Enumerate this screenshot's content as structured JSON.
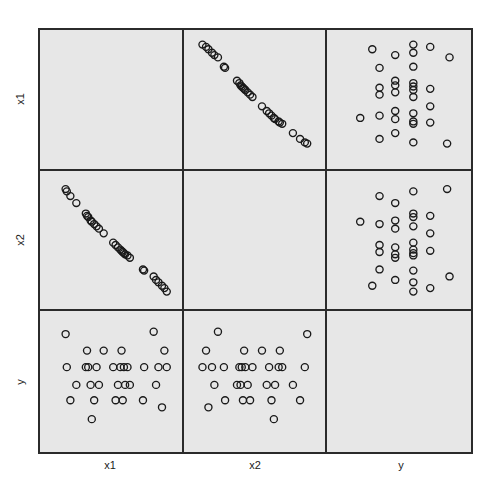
{
  "chart_data": {
    "type": "scatter",
    "title": "",
    "subtitle": "",
    "variables": [
      "x1",
      "x2",
      "y"
    ],
    "xlabel": "",
    "ylabel": "",
    "grid": false,
    "legend": "none",
    "panel_background": "#e7e7e7",
    "marker": "open-circle",
    "marker_color": "#1a1a1a",
    "column_labels": [
      "x1",
      "x2",
      "y"
    ],
    "row_labels": [
      "x1",
      "x2",
      "y"
    ],
    "n_points": 31,
    "axis_ranges": {
      "x1": [
        0,
        1
      ],
      "x2": [
        0,
        1
      ],
      "y": [
        0,
        1
      ]
    },
    "notes": [
      "x1 vs x2 is strongly negatively correlated (near-linear decreasing band).",
      "y is discrete-looking and shows little relationship with x1 or x2."
    ],
    "points": {
      "x1": [
        0.97,
        0.95,
        0.93,
        0.9,
        0.88,
        0.86,
        0.78,
        0.77,
        0.66,
        0.64,
        0.62,
        0.61,
        0.6,
        0.59,
        0.58,
        0.56,
        0.54,
        0.52,
        0.44,
        0.4,
        0.38,
        0.36,
        0.34,
        0.33,
        0.31,
        0.3,
        0.29,
        0.21,
        0.16,
        0.13,
        0.12
      ],
      "x2": [
        0.06,
        0.09,
        0.11,
        0.14,
        0.16,
        0.19,
        0.24,
        0.25,
        0.35,
        0.37,
        0.38,
        0.39,
        0.4,
        0.41,
        0.42,
        0.44,
        0.46,
        0.48,
        0.56,
        0.6,
        0.62,
        0.64,
        0.66,
        0.67,
        0.7,
        0.71,
        0.73,
        0.82,
        0.88,
        0.92,
        0.94
      ],
      "y": [
        0.62,
        0.76,
        0.28,
        0.62,
        0.47,
        0.92,
        0.62,
        0.34,
        0.47,
        0.62,
        0.47,
        0.62,
        0.34,
        0.76,
        0.62,
        0.47,
        0.34,
        0.62,
        0.76,
        0.47,
        0.62,
        0.34,
        0.18,
        0.47,
        0.62,
        0.76,
        0.62,
        0.47,
        0.34,
        0.62,
        0.9
      ]
    },
    "panels": [
      {
        "row": 1,
        "col": 1,
        "x": "x1",
        "y": "x1",
        "kind": "diagonal-blank"
      },
      {
        "row": 1,
        "col": 2,
        "x": "x2",
        "y": "x1",
        "kind": "scatter",
        "relationship": "strong negative"
      },
      {
        "row": 1,
        "col": 3,
        "x": "y",
        "y": "x1",
        "kind": "scatter",
        "relationship": "none"
      },
      {
        "row": 2,
        "col": 1,
        "x": "x1",
        "y": "x2",
        "kind": "scatter",
        "relationship": "strong negative"
      },
      {
        "row": 2,
        "col": 2,
        "x": "x2",
        "y": "x2",
        "kind": "diagonal-blank"
      },
      {
        "row": 2,
        "col": 3,
        "x": "y",
        "y": "x2",
        "kind": "scatter",
        "relationship": "none"
      },
      {
        "row": 3,
        "col": 1,
        "x": "x1",
        "y": "y",
        "kind": "scatter",
        "relationship": "none"
      },
      {
        "row": 3,
        "col": 2,
        "x": "x2",
        "y": "y",
        "kind": "scatter",
        "relationship": "none"
      },
      {
        "row": 3,
        "col": 3,
        "x": "y",
        "y": "y",
        "kind": "diagonal-blank"
      }
    ]
  },
  "labels": {
    "columns": [
      {
        "id": "col-label-x1",
        "text": "x1"
      },
      {
        "id": "col-label-x2",
        "text": "x2"
      },
      {
        "id": "col-label-y",
        "text": "y"
      }
    ],
    "rows": [
      {
        "id": "row-label-x1",
        "text": "x1"
      },
      {
        "id": "row-label-x2",
        "text": "x2"
      },
      {
        "id": "row-label-y",
        "text": "y"
      }
    ]
  }
}
